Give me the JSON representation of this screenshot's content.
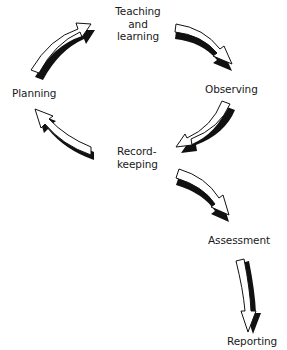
{
  "diagram": {
    "type": "cycle-flow",
    "nodes": {
      "teaching": {
        "lines": [
          "Teaching",
          "and",
          "learning"
        ]
      },
      "observing": {
        "label": "Observing"
      },
      "recordkeeping": {
        "lines": [
          "Record-",
          "keeping"
        ]
      },
      "planning": {
        "label": "Planning"
      },
      "assessment": {
        "label": "Assessment"
      },
      "reporting": {
        "label": "Reporting"
      }
    },
    "edges": [
      {
        "from": "Planning",
        "to": "Teaching and learning"
      },
      {
        "from": "Teaching and learning",
        "to": "Observing"
      },
      {
        "from": "Observing",
        "to": "Record-keeping"
      },
      {
        "from": "Record-keeping",
        "to": "Planning"
      },
      {
        "from": "Record-keeping",
        "to": "Assessment"
      },
      {
        "from": "Assessment",
        "to": "Reporting"
      }
    ],
    "colors": {
      "arrow_fill": "#ffffff",
      "arrow_stroke": "#111111",
      "arrow_shadow": "#111111",
      "text": "#1a1a1a"
    }
  }
}
